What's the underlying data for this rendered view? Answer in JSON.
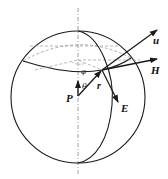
{
  "diagram": {
    "type": "sphere-coordinate-figure",
    "stroke_color": "#1a1a1a",
    "dash_color": "#888888",
    "labels": {
      "u": "u",
      "H": "H",
      "E": "E",
      "P": "P",
      "r": "r",
      "theta": "θ",
      "phi": "φ"
    }
  }
}
